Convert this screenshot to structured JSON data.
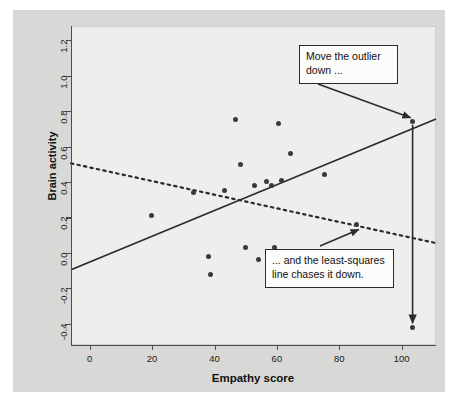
{
  "figure": {
    "background_color": "#d8d8d6",
    "panel_color": "#eeeeec",
    "point_color": "#3a3a3a",
    "line_color": "#2b2b2b"
  },
  "chart_data": {
    "type": "scatter",
    "title": "",
    "xlabel": "Empathy score",
    "ylabel": "Brain activity",
    "xlim": [
      -6,
      111
    ],
    "ylim": [
      -0.52,
      1.28
    ],
    "xticks": [
      0,
      20,
      40,
      60,
      80,
      100
    ],
    "yticks": [
      -0.4,
      -0.2,
      0.0,
      0.2,
      0.4,
      0.6,
      0.8,
      1.0,
      1.2
    ],
    "xtick_labels": [
      "0",
      "20",
      "40",
      "60",
      "80",
      "100"
    ],
    "ytick_labels": [
      "-0.4",
      "-0.2",
      "0.0",
      "0.2",
      "0.4",
      "0.6",
      "0.8",
      "1.0",
      "1.2"
    ],
    "grid": false,
    "legend": null,
    "points": [
      {
        "x": 19.9,
        "y": 0.21
      },
      {
        "x": 33.3,
        "y": 0.34
      },
      {
        "x": 38.1,
        "y": -0.02
      },
      {
        "x": 38.8,
        "y": -0.12
      },
      {
        "x": 43.3,
        "y": 0.35
      },
      {
        "x": 46.8,
        "y": 0.75
      },
      {
        "x": 48.4,
        "y": 0.5
      },
      {
        "x": 49.8,
        "y": 0.03
      },
      {
        "x": 52.8,
        "y": 0.38
      },
      {
        "x": 54.0,
        "y": -0.04
      },
      {
        "x": 56.8,
        "y": 0.4
      },
      {
        "x": 58.4,
        "y": 0.38
      },
      {
        "x": 59.2,
        "y": 0.03
      },
      {
        "x": 60.6,
        "y": 0.73
      },
      {
        "x": 61.5,
        "y": 0.41
      },
      {
        "x": 64.4,
        "y": 0.56
      },
      {
        "x": 66.4,
        "y": 0.01
      },
      {
        "x": 75.3,
        "y": 0.44
      },
      {
        "x": 85.6,
        "y": 0.16
      },
      {
        "x": 103.5,
        "y": 0.74
      },
      {
        "x": 103.5,
        "y": -0.42
      }
    ],
    "lines": [
      {
        "name": "solid-regression-line",
        "style": "solid",
        "x1": -6,
        "y1": -0.095,
        "x2": 111,
        "y2": 0.755
      },
      {
        "name": "dashed-regression-line",
        "style": "dashed",
        "x1": -6,
        "y1": 0.505,
        "x2": 111,
        "y2": 0.055
      }
    ],
    "annotations": [
      {
        "name": "move-outlier-callout",
        "text_lines": [
          "Move the outlier",
          "down ..."
        ],
        "arrow_to": {
          "x": 103.5,
          "y": 0.74
        }
      },
      {
        "name": "least-squares-callout",
        "text_lines": [
          "... and the least-squares",
          "line chases it down."
        ],
        "arrow_to": {
          "x": 85.6,
          "y": 0.16
        }
      },
      {
        "name": "outlier-move-arrow",
        "text_lines": [],
        "arrow_to": {
          "x": 103.5,
          "y": -0.42
        }
      }
    ]
  }
}
